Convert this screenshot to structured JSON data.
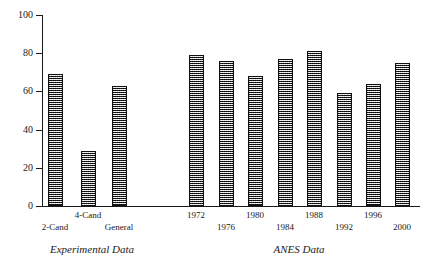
{
  "chart_data": {
    "type": "bar",
    "title": "",
    "subtitle": "",
    "xlabel": "",
    "ylabel": "",
    "ylim": [
      0,
      100
    ],
    "yticks": [
      0,
      20,
      40,
      60,
      80,
      100
    ],
    "grid": false,
    "legend_position": "none",
    "panels": [
      {
        "caption": "Experimental Data",
        "categories": [
          "2-Cand",
          "4-Cand",
          "General"
        ],
        "values": [
          69,
          29,
          63
        ],
        "label_rows": [
          "b",
          "a",
          "b"
        ]
      },
      {
        "caption": "ANES Data",
        "categories": [
          "1972",
          "1976",
          "1980",
          "1984",
          "1988",
          "1992",
          "1996",
          "2000"
        ],
        "values": [
          79,
          76,
          68,
          77,
          81,
          59,
          64,
          75
        ],
        "label_rows": [
          "a",
          "b",
          "a",
          "b",
          "a",
          "b",
          "a",
          "b"
        ]
      }
    ],
    "colors": {
      "bar_fill": "#757575",
      "bar_edge": "#111111",
      "axis": "#1a1a1a",
      "background": "#ffffff"
    }
  }
}
